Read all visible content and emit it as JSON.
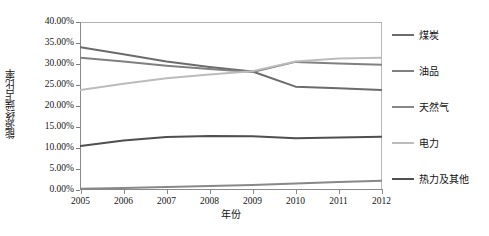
{
  "chart_data": {
    "type": "line",
    "title": "",
    "xlabel": "年份",
    "ylabel": "能源终端占比率",
    "categories": [
      "2005",
      "2006",
      "2007",
      "2008",
      "2009",
      "2010",
      "2011",
      "2012"
    ],
    "x": [
      2005,
      2006,
      2007,
      2008,
      2009,
      2010,
      2011,
      2012
    ],
    "ylim": [
      0,
      40
    ],
    "ytick_labels": [
      "0.00%",
      "5.00%",
      "10.00%",
      "15.00%",
      "20.00%",
      "25.00%",
      "30.00%",
      "35.00%",
      "40.00%"
    ],
    "ytick_values": [
      0,
      5,
      10,
      15,
      20,
      25,
      30,
      35,
      40
    ],
    "grid": false,
    "legend_position": "right",
    "series": [
      {
        "name": "煤炭",
        "color": "#6b6b6b",
        "values": [
          34.0,
          32.3,
          30.6,
          29.3,
          28.2,
          24.6,
          24.2,
          23.8
        ]
      },
      {
        "name": "油品",
        "color": "#808080",
        "values": [
          31.5,
          30.6,
          29.6,
          28.8,
          28.1,
          30.5,
          30.1,
          29.8
        ]
      },
      {
        "name": "天然气",
        "color": "#888888",
        "values": [
          0.3,
          0.45,
          0.7,
          0.95,
          1.2,
          1.55,
          1.9,
          2.2
        ]
      },
      {
        "name": "电力",
        "color": "#bcbcbc",
        "values": [
          23.8,
          25.3,
          26.6,
          27.5,
          28.3,
          30.6,
          31.3,
          31.5
        ]
      },
      {
        "name": "热力及其他",
        "color": "#4f4f4f",
        "values": [
          10.5,
          11.8,
          12.6,
          12.85,
          12.8,
          12.3,
          12.5,
          12.7
        ]
      }
    ]
  },
  "axes": {
    "y_title": "能源终端占比率",
    "x_title": "年份"
  }
}
